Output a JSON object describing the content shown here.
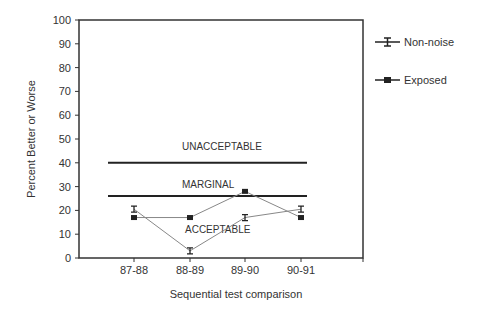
{
  "chart_data": {
    "type": "line",
    "title": "",
    "xlabel": "Sequential test comparison",
    "ylabel": "Percent Better or Worse",
    "ylim": [
      0,
      100
    ],
    "yticks": [
      0,
      10,
      20,
      30,
      40,
      50,
      60,
      70,
      80,
      90,
      100
    ],
    "categories": [
      "87-88",
      "88-89",
      "89-90",
      "90-91"
    ],
    "series": [
      {
        "name": "Non-noise",
        "marker": "error-bar-cap",
        "values": [
          20.5,
          3,
          17,
          20.5
        ]
      },
      {
        "name": "Exposed",
        "marker": "square",
        "values": [
          17,
          17,
          28,
          17
        ]
      }
    ],
    "reference_lines": [
      {
        "value": 40,
        "label_above": "UNACCEPTABLE"
      },
      {
        "value": 26,
        "label_above": "MARGINAL"
      }
    ],
    "zone_labels": [
      {
        "text": "UNACCEPTABLE",
        "y": 47
      },
      {
        "text": "MARGINAL",
        "y": 31
      },
      {
        "text": "ACCEPTABLE",
        "y": 12
      }
    ],
    "legend": {
      "position": "right",
      "entries": [
        "Non-noise",
        "Exposed"
      ]
    },
    "grid": false,
    "colors": {
      "series_line": "#888888",
      "marker": "#222222",
      "ref_line": "#222222",
      "axis": "#333333"
    }
  }
}
